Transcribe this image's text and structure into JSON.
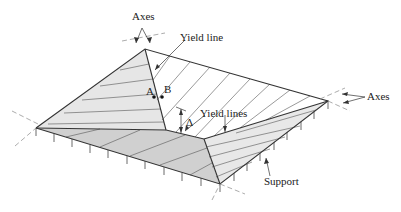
{
  "diagram": {
    "type": "yield-line slab collapse mechanism (isometric)",
    "labels": {
      "axes_top": "Axes",
      "axes_right": "Axes",
      "yield_line": "Yield line",
      "yield_lines": "Yield lines",
      "support": "Support",
      "point_a": "A",
      "point_b": "B",
      "delta": "Δ"
    },
    "colors": {
      "line": "#3a3a3a",
      "shade_light": "#e4e4e4",
      "shade_dark": "#cfcfcf",
      "background": "#ffffff",
      "axis_dash": "#888888"
    }
  }
}
